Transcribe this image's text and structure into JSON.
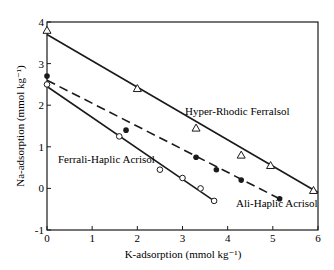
{
  "chart_data": {
    "type": "scatter",
    "title": "",
    "xlabel": "K-adsorption (mmol kg⁻¹)",
    "ylabel": "Na-adsorption (mmol kg⁻¹)",
    "xlim": [
      0,
      6
    ],
    "ylim": [
      -1,
      4
    ],
    "xticks": [
      0,
      1,
      2,
      3,
      4,
      5,
      6
    ],
    "yticks": [
      -1,
      0,
      1,
      2,
      3,
      4
    ],
    "grid": false,
    "legend": "inline labels",
    "series": [
      {
        "name": "Hyper-Rhodic Ferralsol",
        "marker": "open-triangle",
        "line": "solid",
        "fit_line": [
          [
            0,
            3.7
          ],
          [
            6,
            -0.1
          ]
        ],
        "points": [
          [
            0,
            3.8
          ],
          [
            2,
            2.4
          ],
          [
            3.3,
            1.45
          ],
          [
            4.3,
            0.8
          ],
          [
            4.95,
            0.55
          ],
          [
            5.9,
            -0.05
          ]
        ]
      },
      {
        "name": "Ali-Haplic Acrisol",
        "marker": "filled-circle",
        "line": "dashed",
        "fit_line": [
          [
            0,
            2.6
          ],
          [
            5.15,
            -0.25
          ]
        ],
        "points": [
          [
            0,
            2.7
          ],
          [
            1.75,
            1.4
          ],
          [
            3.3,
            0.75
          ],
          [
            3.75,
            0.45
          ],
          [
            4.3,
            0.2
          ],
          [
            5.15,
            -0.25
          ]
        ]
      },
      {
        "name": "Ferrali-Haplic Acrisol",
        "marker": "open-circle",
        "line": "solid",
        "fit_line": [
          [
            0,
            2.45
          ],
          [
            3.7,
            -0.3
          ]
        ],
        "points": [
          [
            0,
            2.5
          ],
          [
            1.6,
            1.25
          ],
          [
            2.5,
            0.45
          ],
          [
            3.0,
            0.25
          ],
          [
            3.4,
            0.0
          ],
          [
            3.7,
            -0.3
          ]
        ]
      }
    ]
  }
}
